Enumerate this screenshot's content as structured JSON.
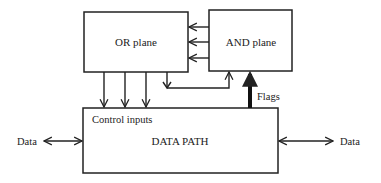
{
  "diagram": {
    "blocks": {
      "or_plane": {
        "label": "OR plane"
      },
      "and_plane": {
        "label": "AND plane"
      },
      "data_path": {
        "label": "DATA PATH",
        "sublabel": "Control inputs"
      }
    },
    "connections": {
      "flags": {
        "label": "Flags"
      },
      "data_left": {
        "label": "Data"
      },
      "data_right": {
        "label": "Data"
      }
    },
    "colors": {
      "stroke": "#222222",
      "background": "#ffffff"
    }
  }
}
